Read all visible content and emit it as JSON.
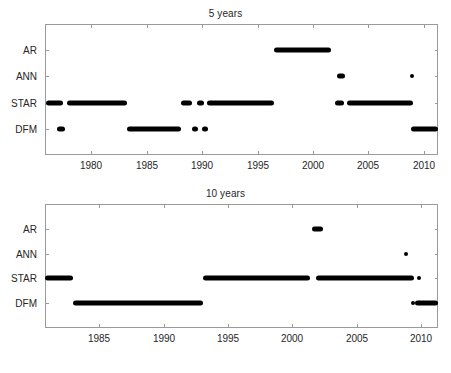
{
  "figure": {
    "width": 451,
    "height": 373,
    "background": "#ffffff",
    "mark_color": "#000000",
    "axis_color": "#9a9a9a",
    "text_color": "#262626"
  },
  "panels": [
    {
      "id": "panel-5",
      "title": "5 years"
    },
    {
      "id": "panel-10",
      "title": "10 years"
    }
  ],
  "chart_data": [
    {
      "type": "scatter",
      "title": "5 years",
      "xlabel": "",
      "ylabel": "",
      "grid": false,
      "legend": "none",
      "xlim": [
        1975.8,
        2011.3
      ],
      "xticks": [
        1980,
        1985,
        1990,
        1995,
        2000,
        2005,
        2010
      ],
      "xticklabels": [
        "1980",
        "1985",
        "1990",
        "1995",
        "2000",
        "2005",
        "2010"
      ],
      "ycategories": [
        "DFM",
        "STAR",
        "ANN",
        "AR"
      ],
      "yticklabels": [
        "AR",
        "ANN",
        "STAR",
        "DFM"
      ],
      "series": [
        {
          "name": "AR",
          "y_index": 3,
          "segments": [
            [
              1996.5,
              2001.6
            ]
          ]
        },
        {
          "name": "ANN",
          "y_index": 2,
          "segments": [
            [
              2002.2,
              2002.9
            ],
            [
              2008.8,
              2008.9
            ]
          ]
        },
        {
          "name": "STAR",
          "y_index": 1,
          "segments": [
            [
              1975.9,
              1977.4
            ],
            [
              1977.8,
              1983.2
            ],
            [
              1988.1,
              1989.1
            ],
            [
              1989.5,
              1990.2
            ],
            [
              1990.4,
              1996.5
            ],
            [
              2002.0,
              2002.8
            ],
            [
              2003.1,
              2009.0
            ]
          ]
        },
        {
          "name": "DFM",
          "y_index": 0,
          "segments": [
            [
              1976.9,
              1977.6
            ],
            [
              1983.2,
              1988.1
            ],
            [
              1989.1,
              1989.6
            ],
            [
              1990.0,
              1990.5
            ],
            [
              2008.9,
              2011.3
            ]
          ]
        }
      ]
    },
    {
      "type": "scatter",
      "title": "10 years",
      "xlabel": "",
      "ylabel": "",
      "grid": false,
      "legend": "none",
      "xlim": [
        1980.8,
        2011.3
      ],
      "xticks": [
        1985,
        1990,
        1995,
        2000,
        2005,
        2010
      ],
      "xticklabels": [
        "1985",
        "1990",
        "1995",
        "2000",
        "2005",
        "2010"
      ],
      "ycategories": [
        "DFM",
        "STAR",
        "ANN",
        "AR"
      ],
      "yticklabels": [
        "AR",
        "ANN",
        "STAR",
        "DFM"
      ],
      "series": [
        {
          "name": "AR",
          "y_index": 3,
          "segments": [
            [
              2001.5,
              2002.4
            ]
          ]
        },
        {
          "name": "ANN",
          "y_index": 2,
          "segments": [
            [
              2008.7,
              2008.9
            ]
          ]
        },
        {
          "name": "STAR",
          "y_index": 1,
          "segments": [
            [
              1980.8,
              1983.0
            ],
            [
              1993.1,
              2001.4
            ],
            [
              2001.8,
              2009.4
            ],
            [
              2009.6,
              2010.0
            ]
          ]
        },
        {
          "name": "DFM",
          "y_index": 0,
          "segments": [
            [
              1983.0,
              1993.1
            ],
            [
              2009.2,
              2009.3
            ],
            [
              2009.5,
              2011.3
            ]
          ]
        }
      ]
    }
  ]
}
